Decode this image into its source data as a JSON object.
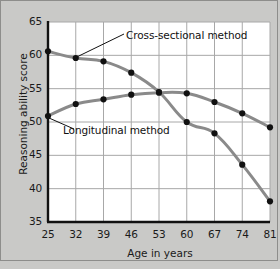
{
  "chart_data": {
    "type": "line",
    "title": "",
    "xlabel": "Age in years",
    "ylabel": "Reasoning ability score",
    "categories": [
      25,
      32,
      39,
      46,
      53,
      60,
      67,
      74,
      81
    ],
    "x": [
      25,
      32,
      39,
      46,
      53,
      60,
      67,
      74,
      81
    ],
    "xtick_labels": [
      "25",
      "32",
      "39",
      "46",
      "53",
      "60",
      "67",
      "74",
      "81"
    ],
    "ytick_labels": [
      "35",
      "40",
      "45",
      "50",
      "55",
      "60",
      "65"
    ],
    "yticks": [
      35,
      40,
      45,
      50,
      55,
      60,
      65
    ],
    "ylim": [
      35,
      65
    ],
    "xlim": [
      25,
      81
    ],
    "grid": true,
    "legend_position": "inline-annotations",
    "series": [
      {
        "name": "Cross-sectional method",
        "values": [
          60.6,
          59.6,
          59.1,
          57.4,
          54.5,
          50.0,
          48.3,
          43.6,
          38.1
        ],
        "line_color": "#8a8a8a",
        "marker_color": "#111111"
      },
      {
        "name": "Longitudinal method",
        "values": [
          50.9,
          52.7,
          53.4,
          54.1,
          54.4,
          54.3,
          53.0,
          51.3,
          49.2
        ],
        "line_color": "#8a8a8a",
        "marker_color": "#111111"
      }
    ],
    "annotations": [
      {
        "text": "Cross-sectional method",
        "anchor_x": 32,
        "anchor_y": 59.6
      },
      {
        "text": "Longitudinal method",
        "anchor_x": 25,
        "anchor_y": 50.9
      }
    ],
    "colors": {
      "background": "#c9c9c7",
      "plot_background": "#ffffff",
      "grid": "#a8a8a8",
      "axis": "#111111",
      "frame": "#8d8d8b"
    }
  }
}
